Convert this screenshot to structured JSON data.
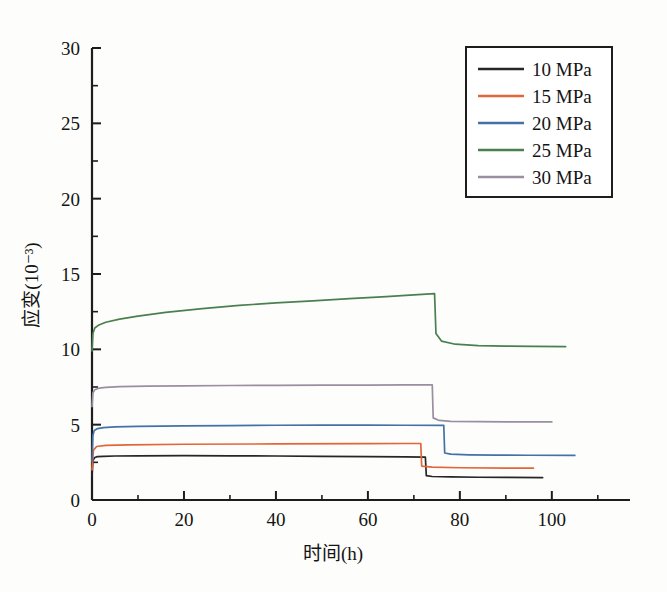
{
  "chart_data": {
    "type": "line",
    "title": "",
    "xlabel": "时间(h)",
    "ylabel": "应变(10⁻³)",
    "xlim": [
      0,
      117
    ],
    "ylim": [
      0,
      30
    ],
    "xticks": [
      0,
      20,
      40,
      60,
      80,
      100
    ],
    "yticks": [
      0,
      5,
      10,
      15,
      20,
      25,
      30
    ],
    "xtick_labels": [
      "0",
      "20",
      "40",
      "60",
      "80",
      "100"
    ],
    "ytick_labels": [
      "0",
      "5",
      "10",
      "15",
      "20",
      "25",
      "30"
    ],
    "x_minor_step": 10,
    "y_minor_step": 2.5,
    "grid": false,
    "legend_position": "top-right",
    "series": [
      {
        "name": "10 MPa",
        "color": "#262626",
        "x": [
          0,
          0.2,
          0.6,
          1.2,
          2.5,
          5,
          10,
          20,
          30,
          40,
          50,
          60,
          68,
          72.5,
          72.7,
          74,
          78,
          84,
          90,
          98
        ],
        "y": [
          1.55,
          2.62,
          2.82,
          2.88,
          2.9,
          2.92,
          2.93,
          2.94,
          2.93,
          2.92,
          2.9,
          2.88,
          2.86,
          2.85,
          1.62,
          1.56,
          1.53,
          1.51,
          1.5,
          1.49
        ]
      },
      {
        "name": "15 MPa",
        "color": "#e2663a",
        "x": [
          0,
          0.3,
          1,
          3,
          8,
          20,
          40,
          60,
          68,
          71.5,
          71.7,
          74,
          80,
          90,
          96
        ],
        "y": [
          2.0,
          3.3,
          3.55,
          3.62,
          3.66,
          3.7,
          3.72,
          3.74,
          3.75,
          3.75,
          2.25,
          2.18,
          2.14,
          2.12,
          2.11
        ]
      },
      {
        "name": "20 MPa",
        "color": "#4472a8",
        "x": [
          0,
          0.2,
          0.5,
          1.2,
          2.5,
          5,
          10,
          20,
          30,
          40,
          50,
          60,
          68,
          76.5,
          76.7,
          78,
          82,
          88,
          95,
          105
        ],
        "y": [
          2.55,
          4.3,
          4.62,
          4.74,
          4.8,
          4.85,
          4.89,
          4.92,
          4.94,
          4.96,
          4.97,
          4.97,
          4.96,
          4.95,
          3.12,
          3.04,
          3.0,
          2.98,
          2.97,
          2.96
        ]
      },
      {
        "name": "25 MPa",
        "color": "#4a8050",
        "x": [
          0,
          0.2,
          0.6,
          1.5,
          3,
          6,
          10,
          16,
          24,
          32,
          40,
          48,
          56,
          64,
          70,
          74.5,
          74.8,
          76,
          79,
          84,
          90,
          96,
          103
        ],
        "y": [
          9.9,
          11.05,
          11.42,
          11.62,
          11.8,
          12.0,
          12.2,
          12.45,
          12.7,
          12.92,
          13.08,
          13.22,
          13.36,
          13.5,
          13.62,
          13.7,
          11.05,
          10.55,
          10.34,
          10.25,
          10.21,
          10.19,
          10.18
        ]
      },
      {
        "name": "30 MPa",
        "color": "#9a8fa0",
        "x": [
          0,
          0.2,
          0.6,
          1.5,
          3,
          6,
          12,
          20,
          30,
          40,
          50,
          60,
          68,
          74.0,
          74.2,
          75.5,
          78,
          84,
          90,
          100
        ],
        "y": [
          6.2,
          7.12,
          7.32,
          7.42,
          7.48,
          7.52,
          7.56,
          7.58,
          7.6,
          7.61,
          7.62,
          7.63,
          7.64,
          7.64,
          5.45,
          5.28,
          5.22,
          5.2,
          5.19,
          5.18
        ]
      }
    ],
    "legend_entries": [
      {
        "label": "10 MPa",
        "color": "#262626"
      },
      {
        "label": "15 MPa",
        "color": "#e2663a"
      },
      {
        "label": "20 MPa",
        "color": "#4472a8"
      },
      {
        "label": "25 MPa",
        "color": "#4a8050"
      },
      {
        "label": "30 MPa",
        "color": "#9a8fa0"
      }
    ]
  }
}
